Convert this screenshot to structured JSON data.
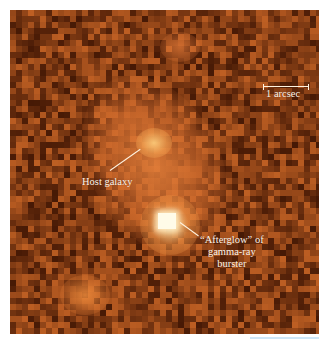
{
  "figure": {
    "labels": {
      "scale": "1 arcsec",
      "host_galaxy": "Host galaxy",
      "afterglow_line1": "“Afterglow” of",
      "afterglow_line2": "gamma-ray",
      "afterglow_line3": "burster"
    },
    "colors": {
      "background_dark": "#5a2208",
      "background_mid": "#8a3a12",
      "background_light": "#c0622a",
      "glow": "#f0a060",
      "afterglow_core": "#fffbe8",
      "annotation": "#fff3e0",
      "page": "#ffffff",
      "strip": "#cfe6f7"
    }
  }
}
